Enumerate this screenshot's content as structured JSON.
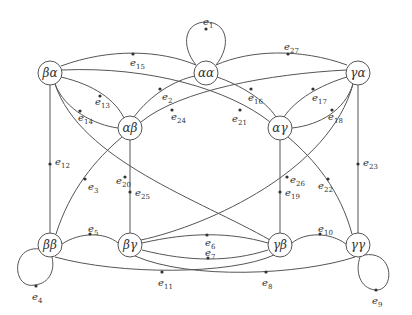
{
  "diagram": {
    "type": "directed-graph",
    "colors": {
      "stroke": "#555555",
      "node_fill": "#ffffff",
      "text": "#333333"
    },
    "nodes": [
      {
        "id": "ba",
        "label": "βα",
        "x": 50,
        "y": 73
      },
      {
        "id": "aa",
        "label": "αα",
        "x": 206,
        "y": 73
      },
      {
        "id": "ga",
        "label": "γα",
        "x": 358,
        "y": 73
      },
      {
        "id": "ab",
        "label": "αβ",
        "x": 130,
        "y": 128
      },
      {
        "id": "ag",
        "label": "αγ",
        "x": 280,
        "y": 128
      },
      {
        "id": "bb",
        "label": "ββ",
        "x": 50,
        "y": 245
      },
      {
        "id": "bg",
        "label": "βγ",
        "x": 130,
        "y": 245
      },
      {
        "id": "gb",
        "label": "γβ",
        "x": 280,
        "y": 245
      },
      {
        "id": "gg",
        "label": "γγ",
        "x": 358,
        "y": 245
      }
    ],
    "edges": [
      {
        "id": "e1",
        "label": "e",
        "sub": "1",
        "from": "aa",
        "to": "aa"
      },
      {
        "id": "e2",
        "label": "e",
        "sub": "2",
        "from": "ab",
        "to": "aa"
      },
      {
        "id": "e3",
        "label": "e",
        "sub": "3",
        "from": "bb",
        "to": "ab"
      },
      {
        "id": "e4",
        "label": "e",
        "sub": "4",
        "from": "bb",
        "to": "bb"
      },
      {
        "id": "e5",
        "label": "e",
        "sub": "5",
        "from": "bb",
        "to": "bg"
      },
      {
        "id": "e6",
        "label": "e",
        "sub": "6",
        "from": "bg",
        "to": "gb"
      },
      {
        "id": "e7",
        "label": "e",
        "sub": "7",
        "from": "gb",
        "to": "bg"
      },
      {
        "id": "e8",
        "label": "e",
        "sub": "8",
        "from": "bg",
        "to": "gg"
      },
      {
        "id": "e9",
        "label": "e",
        "sub": "9",
        "from": "gg",
        "to": "gg"
      },
      {
        "id": "e10",
        "label": "e",
        "sub": "10",
        "from": "gg",
        "to": "gb"
      },
      {
        "id": "e11",
        "label": "e",
        "sub": "11",
        "from": "gb",
        "to": "bb"
      },
      {
        "id": "e12",
        "label": "e",
        "sub": "12",
        "from": "bb",
        "to": "ba"
      },
      {
        "id": "e13",
        "label": "e",
        "sub": "13",
        "from": "ab",
        "to": "ba"
      },
      {
        "id": "e14",
        "label": "e",
        "sub": "14",
        "from": "ab",
        "to": "ba"
      },
      {
        "id": "e15",
        "label": "e",
        "sub": "15",
        "from": "ba",
        "to": "aa"
      },
      {
        "id": "e16",
        "label": "e",
        "sub": "16",
        "from": "ag",
        "to": "aa"
      },
      {
        "id": "e17",
        "label": "e",
        "sub": "17",
        "from": "ag",
        "to": "ga"
      },
      {
        "id": "e18",
        "label": "e",
        "sub": "18",
        "from": "ag",
        "to": "ga"
      },
      {
        "id": "e19",
        "label": "e",
        "sub": "19",
        "from": "gb",
        "to": "ag"
      },
      {
        "id": "e20",
        "label": "e",
        "sub": "20",
        "from": "gb",
        "to": "ba"
      },
      {
        "id": "e21",
        "label": "e",
        "sub": "21",
        "from": "ag",
        "to": "ba"
      },
      {
        "id": "e22",
        "label": "e",
        "sub": "22",
        "from": "ag",
        "to": "gg"
      },
      {
        "id": "e23",
        "label": "e",
        "sub": "23",
        "from": "gg",
        "to": "ga"
      },
      {
        "id": "e24",
        "label": "e",
        "sub": "24",
        "from": "ab",
        "to": "ga"
      },
      {
        "id": "e25",
        "label": "e",
        "sub": "25",
        "from": "ab",
        "to": "bg"
      },
      {
        "id": "e26",
        "label": "e",
        "sub": "26",
        "from": "bg",
        "to": "ga"
      },
      {
        "id": "e27",
        "label": "e",
        "sub": "27",
        "from": "ga",
        "to": "aa"
      }
    ]
  }
}
